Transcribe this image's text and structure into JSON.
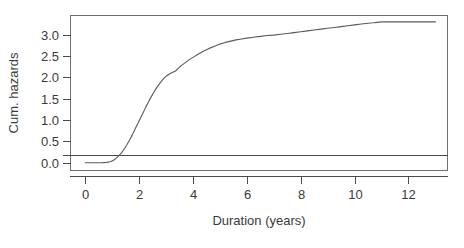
{
  "chart_data": {
    "type": "line",
    "title": "",
    "xlabel": "Duration (years)",
    "ylabel": "Cum. hazards",
    "xlim": [
      -0.55,
      13.45
    ],
    "ylim": [
      -0.18,
      3.45
    ],
    "xticks": [
      0,
      2,
      4,
      6,
      8,
      10,
      12
    ],
    "xtick_labels": [
      "0",
      "2",
      "4",
      "6",
      "8",
      "10",
      "12"
    ],
    "yticks": [
      0.0,
      0.5,
      1.0,
      1.5,
      2.0,
      2.5,
      3.0
    ],
    "ytick_labels": [
      "0.0",
      "0.5",
      "1.0",
      "1.5",
      "2.0",
      "2.5",
      "3.0"
    ],
    "grid": false,
    "legend": "none",
    "box": true,
    "line_color": "#5a5a5a",
    "series": [
      {
        "name": "Cumulative hazard",
        "x": [
          0.0,
          0.3,
          0.6,
          0.8,
          0.95,
          1.05,
          1.15,
          1.25,
          1.35,
          1.45,
          1.55,
          1.65,
          1.75,
          1.85,
          1.95,
          2.05,
          2.15,
          2.25,
          2.35,
          2.45,
          2.55,
          2.65,
          2.75,
          2.85,
          2.95,
          3.05,
          3.15,
          3.25,
          3.35,
          3.45,
          3.55,
          3.7,
          3.85,
          4.0,
          4.2,
          4.4,
          4.6,
          4.8,
          5.0,
          5.2,
          5.4,
          5.6,
          5.8,
          6.0,
          6.25,
          6.5,
          6.75,
          7.0,
          7.25,
          7.5,
          7.75,
          8.0,
          8.25,
          8.5,
          8.75,
          9.0,
          9.25,
          9.5,
          9.75,
          10.0,
          10.25,
          10.5,
          10.7,
          10.85,
          11.0,
          11.5,
          12.0,
          12.5,
          13.0
        ],
        "y": [
          0.0,
          0.0,
          0.0,
          0.01,
          0.03,
          0.06,
          0.11,
          0.17,
          0.24,
          0.33,
          0.43,
          0.54,
          0.66,
          0.79,
          0.92,
          1.05,
          1.18,
          1.31,
          1.43,
          1.55,
          1.66,
          1.76,
          1.85,
          1.93,
          2.0,
          2.05,
          2.09,
          2.12,
          2.15,
          2.21,
          2.27,
          2.34,
          2.41,
          2.47,
          2.55,
          2.62,
          2.68,
          2.73,
          2.78,
          2.82,
          2.85,
          2.88,
          2.9,
          2.92,
          2.94,
          2.96,
          2.98,
          2.99,
          3.01,
          3.03,
          3.05,
          3.07,
          3.09,
          3.11,
          3.13,
          3.15,
          3.17,
          3.19,
          3.21,
          3.23,
          3.25,
          3.27,
          3.28,
          3.29,
          3.3,
          3.3,
          3.3,
          3.3,
          3.3
        ]
      }
    ],
    "annotations": {
      "baseline_y": 0.0,
      "plateau_value": 3.3,
      "onset_x": 0.95,
      "steep_region": [
        1.5,
        3.3
      ]
    }
  },
  "figure": {
    "background": "#ffffff",
    "axis_color": "#4a4a4a",
    "text_color": "#3a3a3a"
  }
}
